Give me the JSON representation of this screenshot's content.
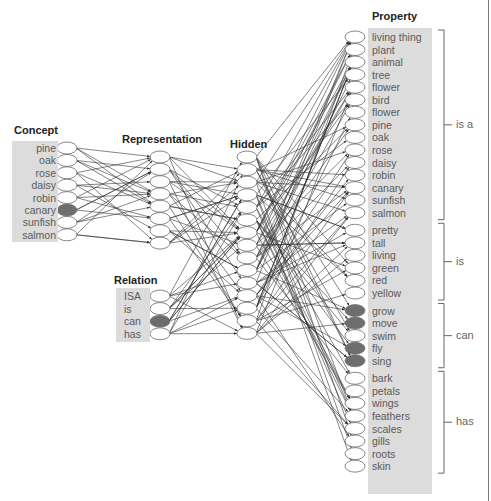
{
  "layers": {
    "concept": {
      "title": "Concept",
      "items": [
        "pine",
        "oak",
        "rose",
        "daisy",
        "robin",
        "canary",
        "sunfish",
        "salmon"
      ],
      "active": [
        5
      ]
    },
    "representation": {
      "title": "Representation",
      "node_count": 8
    },
    "relation": {
      "title": "Relation",
      "items": [
        "ISA",
        "is",
        "can",
        "has"
      ],
      "active": [
        2
      ]
    },
    "hidden": {
      "title": "Hidden",
      "node_count": 15
    },
    "property": {
      "title": "Property",
      "groups": [
        {
          "label": "is a",
          "items": [
            "living thing",
            "plant",
            "animal",
            "tree",
            "flower",
            "bird",
            "flower",
            "pine",
            "oak",
            "rose",
            "daisy",
            "robin",
            "canary",
            "sunfish",
            "salmon"
          ]
        },
        {
          "label": "is",
          "items": [
            "pretty",
            "tall",
            "living",
            "green",
            "red",
            "yellow"
          ]
        },
        {
          "label": "can",
          "items": [
            "grow",
            "move",
            "swim",
            "fly",
            "sing"
          ]
        },
        {
          "label": "has",
          "items": [
            "bark",
            "petals",
            "wings",
            "feathers",
            "scales",
            "gills",
            "roots",
            "skin"
          ]
        }
      ],
      "active": [
        "grow",
        "move",
        "fly",
        "sing"
      ]
    }
  },
  "colors": {
    "active_node": "#6e6e6e",
    "box": "#dcdcdc",
    "line": "#333333"
  }
}
